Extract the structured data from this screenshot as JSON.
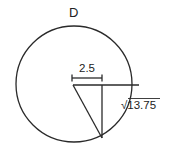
{
  "diagram": {
    "title_label": "D",
    "radius_segment_label": "2.5",
    "chord_half_label": "√13.75",
    "colors": {
      "stroke": "#2a2a2a",
      "text": "#222222",
      "background": "#ffffff"
    }
  }
}
